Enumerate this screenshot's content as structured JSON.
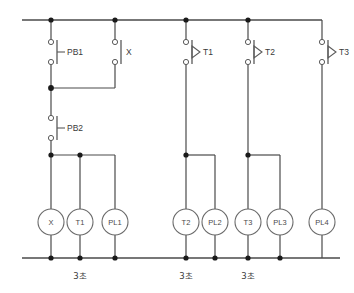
{
  "diagram": {
    "type": "relay-ladder-control-circuit",
    "title": "",
    "colors": {
      "wire": "#4a4a4a",
      "node": "#1a1a1a",
      "symbol": "#5a5a5a",
      "text": "#3a3a3a",
      "background": "#ffffff"
    },
    "rails": {
      "top_y": 20,
      "bottom_y": 258,
      "left_x": 22,
      "right_x": 340
    },
    "contacts": [
      {
        "id": "PB1",
        "label": "PB1",
        "kind": "pushbutton-no",
        "x": 51,
        "y_top": 42,
        "y_bot": 62,
        "marker": "tick-left"
      },
      {
        "id": "X",
        "label": "X",
        "kind": "relay-contact-no",
        "x": 115,
        "y_top": 42,
        "y_bot": 62,
        "marker": "bar"
      },
      {
        "id": "PB2",
        "label": "PB2",
        "kind": "pushbutton-nc",
        "x": 51,
        "y_top": 118,
        "y_bot": 138,
        "marker": "tick-left"
      },
      {
        "id": "T1",
        "label": "T1",
        "kind": "timer-contact-on-delay",
        "x": 186,
        "y_top": 42,
        "y_bot": 62,
        "marker": "triangle"
      },
      {
        "id": "T2",
        "label": "T2",
        "kind": "timer-contact-on-delay",
        "x": 248,
        "y_top": 42,
        "y_bot": 62,
        "marker": "triangle"
      },
      {
        "id": "T3",
        "label": "T3",
        "kind": "timer-contact-on-delay",
        "x": 322,
        "y_top": 42,
        "y_bot": 62,
        "marker": "triangle"
      }
    ],
    "coils": [
      {
        "id": "X",
        "label": "X",
        "kind": "relay-coil",
        "x": 51,
        "y": 222,
        "r": 13
      },
      {
        "id": "T1",
        "label": "T1",
        "kind": "timer-coil",
        "x": 80,
        "y": 222,
        "r": 13
      },
      {
        "id": "PL1",
        "label": "PL1",
        "kind": "pilot-lamp",
        "x": 115,
        "y": 222,
        "r": 13
      },
      {
        "id": "T2",
        "label": "T2",
        "kind": "timer-coil",
        "x": 186,
        "y": 222,
        "r": 13
      },
      {
        "id": "PL2",
        "label": "PL2",
        "kind": "pilot-lamp",
        "x": 215,
        "y": 222,
        "r": 13
      },
      {
        "id": "T3",
        "label": "T3",
        "kind": "timer-coil",
        "x": 248,
        "y": 222,
        "r": 13
      },
      {
        "id": "PL3",
        "label": "PL3",
        "kind": "pilot-lamp",
        "x": 280,
        "y": 222,
        "r": 13
      },
      {
        "id": "PL4",
        "label": "PL4",
        "kind": "pilot-lamp",
        "x": 322,
        "y": 222,
        "r": 13
      }
    ],
    "timer_labels": [
      {
        "id": "t1",
        "text": "3초",
        "x": 80,
        "y": 276
      },
      {
        "id": "t2",
        "text": "3초",
        "x": 186,
        "y": 276
      },
      {
        "id": "t3",
        "text": "3초",
        "x": 248,
        "y": 276
      }
    ],
    "nodes_top": [
      51,
      115,
      186,
      248
    ],
    "nodes_mid": [
      51
    ],
    "nodes_bus": [
      51,
      80,
      186,
      248
    ],
    "nodes_bottom": [
      51,
      80,
      115,
      186,
      215,
      248,
      280
    ]
  }
}
